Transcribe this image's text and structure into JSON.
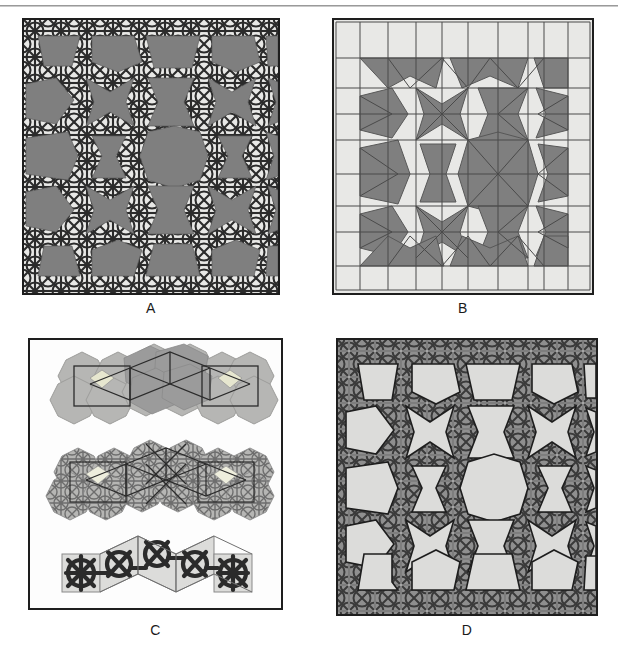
{
  "figure": {
    "kind": "multi-panel-figure",
    "panel_count": 4,
    "top_rule": true,
    "background_color": "#ffffff"
  },
  "palette": {
    "paper": "#ffffff",
    "light_tile": "#e8e8e6",
    "mid_gray": "#9b9b9b",
    "dark_fill": "#7f7f7f",
    "interlace_stroke": "#2b2b2b",
    "thin_line": "#4a4a4a",
    "panel_border": "#1e1e1e",
    "label_color": "#1a1a1a",
    "rule_color": "#9a9a9a"
  },
  "panels": [
    {
      "id": "A",
      "label": "A",
      "caption": "A",
      "description": "Interlaced strapwork pattern overlaid on dark-gray polygonal tiles",
      "style": "interlace-over-dark-polygons",
      "border": true,
      "grid": {
        "cols": 5,
        "rows": 5
      },
      "fill": "#7f7f7f",
      "background": "#e8e8e6",
      "stroke": "#2b2b2b"
    },
    {
      "id": "B",
      "label": "B",
      "caption": "B",
      "description": "Underlying polygonal tiling drawn with thin line edges, dark-gray cells",
      "style": "polygon-tiling-line-edges",
      "border": true,
      "grid": {
        "cols": 5,
        "rows": 5
      },
      "fill": "#7f7f7f",
      "background": "#e8e8e6",
      "stroke": "#4a4a4a"
    },
    {
      "id": "C",
      "label": "C",
      "caption": "C",
      "description": "Three construction stages shown as horizontal strips: polygon cluster, overlaid motif, and extracted interlace",
      "style": "construction-stages",
      "border": true,
      "rows": [
        {
          "name": "stage-1-polygon-cluster",
          "description": "Chain of octagons and squares with black guide quadrilaterals"
        },
        {
          "name": "stage-2-motif-overlay",
          "description": "Same cluster with fine geometric motif lines added"
        },
        {
          "name": "stage-3-interlace-strip",
          "description": "Resulting thick black interlace strapwork on light tiles"
        }
      ]
    },
    {
      "id": "D",
      "label": "D",
      "caption": "D",
      "description": "Inverted rendering: light polygons outlined in black over a dense dark interlace field",
      "style": "light-polygons-over-interlace",
      "border": true,
      "grid": {
        "cols": 5,
        "rows": 5
      },
      "fill": "#dcdcda",
      "background": "#8f8f8f",
      "stroke": "#2b2b2b"
    }
  ]
}
